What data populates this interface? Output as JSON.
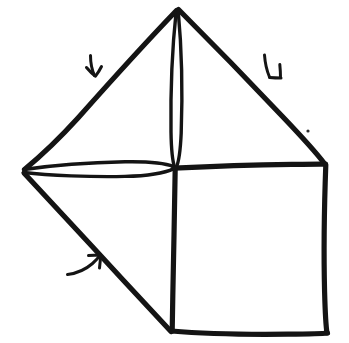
{
  "figure": {
    "title": "Hand-drawn origami fold diagram",
    "style": {
      "ink_color": "#141414",
      "background_color": "#ffffff",
      "line_quality": "hand-drawn ink, uneven weight"
    },
    "canvas": {
      "width": 349,
      "height": 343
    }
  },
  "vertices": [
    {
      "id": "apex",
      "label": "apex",
      "x": 177,
      "y": 8
    },
    {
      "id": "left",
      "label": "left vertex",
      "x": 22,
      "y": 171
    },
    {
      "id": "right",
      "label": "right vertex",
      "x": 325,
      "y": 164
    },
    {
      "id": "center",
      "label": "center crossing",
      "x": 175,
      "y": 168
    },
    {
      "id": "bottom-left",
      "label": "bottom-left corner",
      "x": 172,
      "y": 331
    },
    {
      "id": "bottom-right",
      "label": "bottom-right corner",
      "x": 327,
      "y": 333
    }
  ],
  "edges": [
    {
      "id": "apex-to-left",
      "label": "upper-left slant edge",
      "from": "apex",
      "to": "left",
      "kind": "straight"
    },
    {
      "id": "apex-to-right",
      "label": "upper-right slant edge",
      "from": "apex",
      "to": "right",
      "kind": "straight"
    },
    {
      "id": "apex-to-center",
      "label": "central vertical crease",
      "from": "apex",
      "to": "center",
      "kind": "narrow-lens"
    },
    {
      "id": "left-to-center",
      "label": "left horizontal crease",
      "from": "left",
      "to": "center",
      "kind": "narrow-lens"
    },
    {
      "id": "center-to-right",
      "label": "right horizontal edge",
      "from": "center",
      "to": "right",
      "kind": "straight"
    },
    {
      "id": "center-to-bottom-left",
      "label": "lower vertical crease",
      "from": "center",
      "to": "bottom-left",
      "kind": "straight"
    },
    {
      "id": "left-to-bottom-left",
      "label": "lower-left diagonal flap edge",
      "from": "left",
      "to": "bottom-left",
      "kind": "straight"
    },
    {
      "id": "right-to-bottom-right",
      "label": "right vertical edge",
      "from": "right",
      "to": "bottom-right",
      "kind": "straight"
    },
    {
      "id": "bottom-left-to-bottom-right",
      "label": "bottom edge",
      "from": "bottom-left",
      "to": "bottom-right",
      "kind": "straight"
    }
  ],
  "arrows": [
    {
      "id": "arrow-upper-left",
      "label": "fold arrow on upper-left slant edge",
      "direction": "down-right",
      "glyph": "curved-hook-arrow",
      "anchor_x": 95,
      "anchor_y": 66
    },
    {
      "id": "arrow-upper-right",
      "label": "fold arrow on upper-right slant edge",
      "direction": "down-left",
      "glyph": "curved-hook-arrow",
      "anchor_x": 267,
      "anchor_y": 68
    },
    {
      "id": "arrow-lower-left",
      "label": "fold arrow on lower-left diagonal edge",
      "direction": "up-right",
      "glyph": "curved-hook-arrow",
      "anchor_x": 83,
      "anchor_y": 266
    }
  ],
  "marks": [
    {
      "id": "ink-speck",
      "label": "stray ink speck",
      "x": 308,
      "y": 131,
      "radius": 1.6
    }
  ]
}
